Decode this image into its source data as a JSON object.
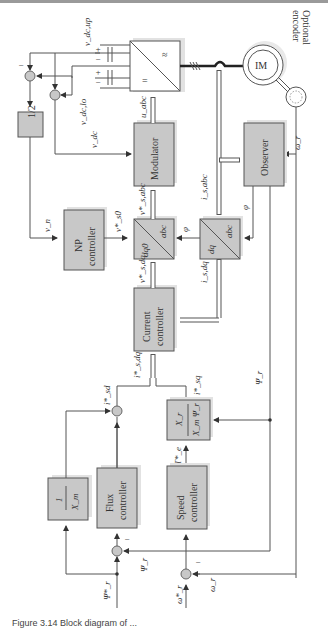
{
  "diagram": {
    "orientation": "rotated-90-ccw",
    "blocks": {
      "half": "1/2",
      "converter_dc": "=",
      "converter_ac": "≈",
      "motor": "IM",
      "encoder_label_line1": "Optional",
      "encoder_label_line2": "encoder",
      "modulator": "Modulator",
      "observer": "Observer",
      "np_controller_line1": "NP",
      "np_controller_line2": "controller",
      "dq0_abc_left": "dq0",
      "dq0_abc_right": "abc",
      "dq_abc_left": "dq",
      "dq_abc_right": "abc",
      "current_controller_line1": "Current",
      "current_controller_line2": "controller",
      "torque_to_iq_num": "X_r",
      "torque_to_iq_den": "X_m Ψ_r",
      "inv_xm_num": "1",
      "inv_xm_den": "X_m",
      "flux_controller_line1": "Flux",
      "flux_controller_line2": "controller",
      "speed_controller_line1": "Speed",
      "speed_controller_line2": "controller"
    },
    "signals": {
      "v_dc_up": "v_dc,up",
      "v_dc_lo": "v_dc,lo",
      "v_dc": "v_dc",
      "v_n": "v_n",
      "u_abc": "u_abc",
      "v_s_abc_ref": "v*_s,abc",
      "v_s0_ref": "v*_s0",
      "v_s_dq_ref": "v*_s,dq",
      "i_s_abc": "i_s,abc",
      "i_s_dq": "i_s,dq",
      "i_s_dq_ref": "i*_s,dq",
      "i_sd_ref": "i*_sd",
      "i_sq_ref": "i*_sq",
      "phi_1": "φ",
      "phi_2": "φ",
      "omega_r_obs": "ω_r",
      "psi_r_obs": "Ψ_r",
      "psi_r_fb": "Ψ_r",
      "psi_r_ref": "Ψ*_r",
      "torque_ref": "T*_e",
      "omega_r_ref": "ω*_r",
      "omega_r_fb": "ω_r",
      "minus_sign": "−",
      "plus_sign": "+"
    },
    "caption": "Figure 3.14  Block diagram of ..."
  }
}
